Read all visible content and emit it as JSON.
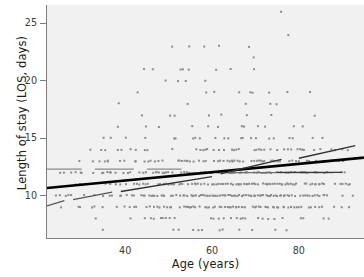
{
  "figure": {
    "kind": "scatter-plot",
    "background_color": "#ffffff",
    "panel_color": "#f1f1f1"
  },
  "chart_data": {
    "type": "scatter",
    "title": "",
    "subtitle": "",
    "xlabel": "Age (years)",
    "ylabel": "Length of stay (LOS, days)",
    "xlim": [
      22,
      95
    ],
    "ylim": [
      6.3,
      26.6
    ],
    "grid": false,
    "legend": null,
    "x_ticks": [
      30,
      40,
      50,
      60,
      70,
      80,
      90
    ],
    "x_tick_labels": [
      "",
      "40",
      "",
      "60",
      "",
      "80",
      ""
    ],
    "x_minor_ticks": [
      25,
      35,
      45,
      55,
      65,
      75,
      85,
      95
    ],
    "y_ticks": [
      10,
      15,
      20,
      25
    ],
    "y_tick_labels": [
      "10",
      "15",
      "20",
      "25"
    ],
    "marker": {
      "shape": "square",
      "size_px": 2,
      "color": "#8c8c8c"
    },
    "series": [
      {
        "name": "patients",
        "kind": "points",
        "color": "#8c8c8c",
        "n_points_approx": 1400,
        "bands": [
          {
            "los": 7,
            "age_min": 33,
            "age_max": 78,
            "density": 0.1
          },
          {
            "los": 8,
            "age_min": 29,
            "age_max": 90,
            "density": 0.26
          },
          {
            "los": 9,
            "age_min": 25,
            "age_max": 92,
            "density": 0.55
          },
          {
            "los": 10,
            "age_min": 24,
            "age_max": 93,
            "density": 0.78
          },
          {
            "los": 11,
            "age_min": 24,
            "age_max": 92,
            "density": 0.72
          },
          {
            "los": 12,
            "age_min": 24,
            "age_max": 92,
            "density": 0.62
          },
          {
            "los": 13,
            "age_min": 26,
            "age_max": 92,
            "density": 0.5
          },
          {
            "los": 14,
            "age_min": 28,
            "age_max": 92,
            "density": 0.34
          },
          {
            "los": 15,
            "age_min": 30,
            "age_max": 91,
            "density": 0.18
          },
          {
            "los": 16,
            "age_min": 34,
            "age_max": 88,
            "density": 0.11
          },
          {
            "los": 17,
            "age_min": 33,
            "age_max": 85,
            "density": 0.09
          },
          {
            "los": 18,
            "age_min": 36,
            "age_max": 84,
            "density": 0.07
          },
          {
            "los": 19,
            "age_min": 35,
            "age_max": 83,
            "density": 0.07
          },
          {
            "los": 20,
            "age_min": 34,
            "age_max": 86,
            "density": 0.05
          },
          {
            "los": 21,
            "age_min": 35,
            "age_max": 84,
            "density": 0.04
          },
          {
            "los": 22,
            "age_min": 45,
            "age_max": 87,
            "density": 0.03
          },
          {
            "los": 23,
            "age_min": 26,
            "age_max": 86,
            "density": 0.03
          },
          {
            "los": 24,
            "age_min": 66,
            "age_max": 85,
            "density": 0.01
          },
          {
            "los": 26,
            "age_min": 57,
            "age_max": 90,
            "density": 0.01
          }
        ]
      },
      {
        "name": "linear-fit",
        "kind": "line",
        "style": "solid-thick",
        "color": "#000000",
        "width_px": 2.6,
        "x": [
          22,
          95
        ],
        "y": [
          10.65,
          13.3
        ]
      },
      {
        "name": "reference-segment-low-left",
        "kind": "line",
        "style": "solid-thin",
        "color": "#555555",
        "width_px": 1.2,
        "x": [
          22,
          26
        ],
        "y": [
          9.1,
          9.55
        ]
      },
      {
        "name": "reference-segment-rising-left",
        "kind": "line",
        "style": "solid-thin",
        "color": "#555555",
        "width_px": 1.2,
        "x": [
          28,
          37
        ],
        "y": [
          9.65,
          10.3
        ]
      },
      {
        "name": "reference-segment-rising-mid",
        "kind": "line",
        "style": "solid-thin",
        "color": "#333333",
        "width_px": 1.4,
        "x": [
          39,
          60
        ],
        "y": [
          10.35,
          11.65
        ]
      },
      {
        "name": "reference-segment-rising-right",
        "kind": "line",
        "style": "solid-thin",
        "color": "#333333",
        "width_px": 1.4,
        "x": [
          62,
          76
        ],
        "y": [
          11.9,
          13.15
        ]
      },
      {
        "name": "reference-segment-top-right",
        "kind": "line",
        "style": "solid-thin",
        "color": "#333333",
        "width_px": 1.4,
        "x": [
          80,
          93
        ],
        "y": [
          13.25,
          14.35
        ]
      },
      {
        "name": "flat-band-12_3-left",
        "kind": "line",
        "style": "solid-thin",
        "color": "#8a8a8a",
        "width_px": 1.1,
        "x": [
          22,
          30
        ],
        "y": [
          12.3,
          12.3
        ]
      },
      {
        "name": "flat-band-12_3-seg2",
        "kind": "line",
        "style": "solid-thin",
        "color": "#8a8a8a",
        "width_px": 1.1,
        "x": [
          33,
          42
        ],
        "y": [
          12.3,
          12.3
        ]
      },
      {
        "name": "flat-band-12_3-seg3",
        "kind": "line",
        "style": "solid-thin",
        "color": "#8a8a8a",
        "width_px": 1.1,
        "x": [
          45,
          53
        ],
        "y": [
          12.3,
          12.3
        ]
      },
      {
        "name": "flat-band-12_0-right",
        "kind": "line",
        "style": "solid-thin",
        "color": "#6f6f6f",
        "width_px": 1.2,
        "x": [
          64,
          88
        ],
        "y": [
          12.0,
          12.0
        ]
      },
      {
        "name": "flat-band-12_0-right-tail",
        "kind": "line",
        "style": "solid-thin",
        "color": "#3a3a3a",
        "width_px": 1.3,
        "x": [
          75,
          90
        ],
        "y": [
          12.02,
          12.02
        ]
      }
    ]
  }
}
